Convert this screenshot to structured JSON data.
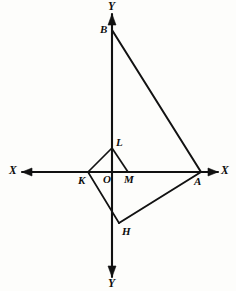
{
  "figure": {
    "background_color": "#fdfdfb",
    "ink_color": "#111111",
    "width": 236,
    "height": 291
  },
  "axes": {
    "x_axis": {
      "name": "horizontal-axis",
      "label_left": "X",
      "label_right": "X",
      "y": 172,
      "x_start": 22,
      "x_end": 218,
      "arrows": "both"
    },
    "y_axis": {
      "name": "vertical-axis",
      "label_top": "Y",
      "label_bottom": "Y",
      "x": 112,
      "y_start": 14,
      "y_end": 277,
      "arrows": "both"
    }
  },
  "points": [
    {
      "id": "B",
      "label": "B",
      "x": 112,
      "y": 30,
      "label_x": 100,
      "label_y": 24
    },
    {
      "id": "L",
      "label": "L",
      "x": 112,
      "y": 148,
      "label_x": 116,
      "label_y": 137
    },
    {
      "id": "K",
      "label": "K",
      "x": 88,
      "y": 172,
      "label_x": 78,
      "label_y": 175
    },
    {
      "id": "O",
      "label": "O",
      "x": 112,
      "y": 172,
      "label_x": 103,
      "label_y": 174
    },
    {
      "id": "M",
      "label": "M",
      "x": 128,
      "y": 172,
      "label_x": 124,
      "label_y": 174
    },
    {
      "id": "A",
      "label": "A",
      "x": 201,
      "y": 172,
      "label_x": 194,
      "label_y": 176
    },
    {
      "id": "H",
      "label": "H",
      "x": 119,
      "y": 223,
      "label_x": 122,
      "label_y": 226
    }
  ],
  "segments": [
    {
      "name": "segment-B-A",
      "from": "B",
      "to": "A",
      "weight": "thick"
    },
    {
      "name": "segment-K-L",
      "from": "K",
      "to": "L",
      "weight": "thin"
    },
    {
      "name": "segment-L-M",
      "from": "L",
      "to": "M",
      "weight": "thin"
    },
    {
      "name": "segment-K-H",
      "from": "K",
      "to": "H",
      "weight": "thin"
    },
    {
      "name": "segment-H-A",
      "from": "H",
      "to": "A",
      "weight": "thick"
    }
  ],
  "axis_labels": {
    "x_left": "X",
    "x_right": "X",
    "y_top": "Y",
    "y_bottom": "Y"
  },
  "point_labels": {
    "B": "B",
    "L": "L",
    "K": "K",
    "O": "O",
    "M": "M",
    "A": "A",
    "H": "H"
  }
}
